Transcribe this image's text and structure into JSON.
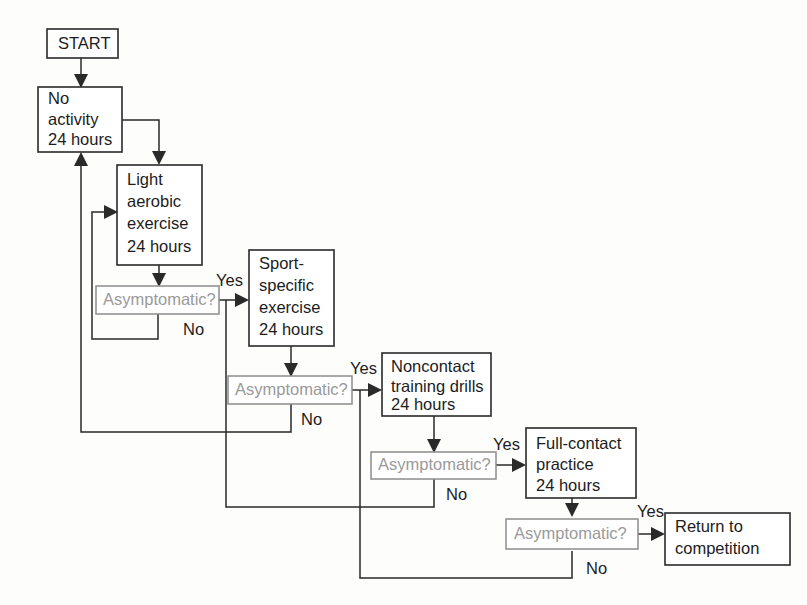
{
  "diagram": {
    "colors": {
      "box_stroke": "#2a2a2a",
      "decision_stroke": "#8c8c8c",
      "decision_text": "#9a9a9a",
      "text": "#1c1c1c",
      "background": "#fdfdfc"
    },
    "nodes": {
      "start": {
        "label": "START"
      },
      "no_activity": {
        "line1": "No",
        "line2": "activity",
        "line3": "24 hours"
      },
      "light_aerobic": {
        "line1": "Light",
        "line2": "aerobic",
        "line3": "exercise",
        "line4": "24 hours"
      },
      "sport_specific": {
        "line1": "Sport-",
        "line2": "specific",
        "line3": "exercise",
        "line4": "24 hours"
      },
      "noncontact": {
        "line1": "Noncontact",
        "line2": "training drills",
        "line3": "24 hours"
      },
      "full_contact": {
        "line1": "Full-contact",
        "line2": "practice",
        "line3": "24 hours"
      },
      "return": {
        "line1": "Return to",
        "line2": "competition"
      }
    },
    "decisions": {
      "d1": {
        "label": "Asymptomatic?"
      },
      "d2": {
        "label": "Asymptomatic?"
      },
      "d3": {
        "label": "Asymptomatic?"
      },
      "d4": {
        "label": "Asymptomatic?"
      }
    },
    "branch_labels": {
      "yes1": "Yes",
      "no1": "No",
      "yes2": "Yes",
      "no2": "No",
      "yes3": "Yes",
      "no3": "No",
      "yes4": "Yes",
      "no4": "No"
    }
  }
}
